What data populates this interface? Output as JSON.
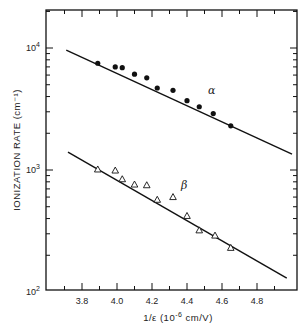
{
  "chart_data": {
    "type": "scatter",
    "title": "",
    "xlabel": "1/ε (10⁻⁶ cm/V)",
    "ylabel": "IONIZATION RATE (cm⁻¹)",
    "xlim": [
      3.6,
      5.0
    ],
    "ylim": [
      100,
      20000
    ],
    "yscale": "log",
    "x_ticks": [
      "3.8",
      "4.0",
      "4.2",
      "4.4",
      "4.6",
      "4.8"
    ],
    "y_ticks": [
      "10²",
      "10³",
      "10⁴"
    ],
    "grid": false,
    "series": [
      {
        "name": "α",
        "marker": "filled-circle",
        "points": [
          [
            3.89,
            7500
          ],
          [
            3.99,
            7000
          ],
          [
            4.03,
            6900
          ],
          [
            4.1,
            6100
          ],
          [
            4.17,
            5700
          ],
          [
            4.23,
            4700
          ],
          [
            4.32,
            4500
          ],
          [
            4.4,
            3700
          ],
          [
            4.47,
            3300
          ],
          [
            4.55,
            2900
          ],
          [
            4.65,
            2300
          ]
        ],
        "fit_line": [
          [
            3.71,
            9600
          ],
          [
            5.0,
            1350
          ]
        ]
      },
      {
        "name": "β",
        "marker": "open-triangle",
        "points": [
          [
            3.89,
            1010
          ],
          [
            3.99,
            990
          ],
          [
            4.03,
            840
          ],
          [
            4.1,
            760
          ],
          [
            4.17,
            750
          ],
          [
            4.23,
            570
          ],
          [
            4.32,
            600
          ],
          [
            4.4,
            420
          ],
          [
            4.47,
            320
          ],
          [
            4.56,
            290
          ],
          [
            4.65,
            230
          ]
        ],
        "fit_line": [
          [
            3.72,
            1400
          ],
          [
            4.97,
            130
          ]
        ]
      }
    ],
    "annotations": [
      {
        "text": "α",
        "x": 4.55,
        "y": 4800
      },
      {
        "text": "β",
        "x": 4.31,
        "y": 820
      }
    ]
  },
  "labels": {
    "ylabel": "IONIZATION RATE (cm⁻¹)",
    "xlabel_main": "1/ε (10",
    "xlabel_exp": "-6",
    "xlabel_tail": " cm/V)",
    "alpha": "α",
    "beta": "β",
    "y_ticks": [
      {
        "base": "10",
        "exp": "2"
      },
      {
        "base": "10",
        "exp": "3"
      },
      {
        "base": "10",
        "exp": "4"
      }
    ],
    "x_ticks": [
      "3.8",
      "4.0",
      "4.2",
      "4.4",
      "4.6",
      "4.8"
    ]
  }
}
